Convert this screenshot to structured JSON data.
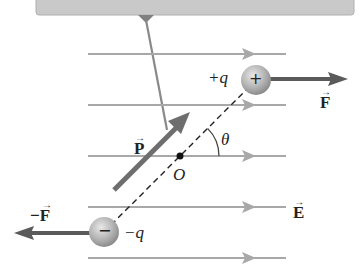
{
  "diagram": {
    "field": {
      "label": "E",
      "line_y": [
        54,
        105,
        156,
        207,
        258
      ],
      "x_start": 88,
      "x_end": 286,
      "color": "#a8a8a8"
    },
    "positive_charge": {
      "label": "+q",
      "symbol": "+",
      "x": 256,
      "y": 80
    },
    "negative_charge": {
      "label": "−q",
      "symbol": "−",
      "x": 104,
      "y": 232
    },
    "center": {
      "label": "O",
      "x": 180,
      "y": 156
    },
    "angle": {
      "label": "θ"
    },
    "dipole_moment": {
      "label": "P"
    },
    "force_positive": {
      "label": "F"
    },
    "force_negative": {
      "label": "−F"
    },
    "vector_arrow_glyph": "→",
    "colors": {
      "callout_box": "#c9c9c9",
      "force_arrow": "#5a5a5a",
      "dipole_arrow": "#6e6e6e",
      "charge_sphere": "#b9b9b9",
      "text": "#222222"
    }
  }
}
